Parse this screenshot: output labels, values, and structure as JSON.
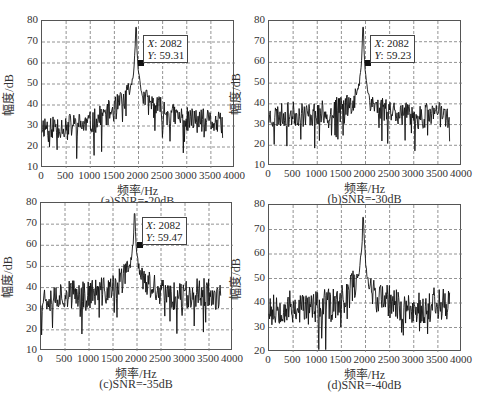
{
  "figure_caption": "",
  "chart_data": [
    {
      "id": "a",
      "type": "line",
      "caption": "(a)SNR=-20dB",
      "xlabel": "频率/Hz",
      "ylabel": "幅度/dB",
      "xlim": [
        0,
        4000
      ],
      "ylim": [
        10,
        80
      ],
      "xticks": [
        0,
        500,
        1000,
        1500,
        2000,
        2500,
        3000,
        3500,
        4000
      ],
      "yticks": [
        10,
        20,
        30,
        40,
        50,
        60,
        70,
        80
      ],
      "grid": true,
      "peak": {
        "x": 1950,
        "y": 77
      },
      "datatip": {
        "x_label": "X",
        "x_value": "2082",
        "y_label": "Y",
        "y_value": "59.31",
        "x": 2082,
        "y": 59.31
      },
      "series": [
        {
          "name": "spectrum",
          "baseline": [
            [
              0,
              30
            ],
            [
              500,
              30
            ],
            [
              1000,
              31
            ],
            [
              1500,
              38
            ],
            [
              1800,
              44
            ],
            [
              2300,
              40
            ],
            [
              2700,
              35
            ],
            [
              3000,
              33
            ],
            [
              3500,
              32
            ],
            [
              3750,
              30
            ]
          ],
          "noise_amp": 6,
          "seed": 11
        }
      ]
    },
    {
      "id": "b",
      "type": "line",
      "caption": "(b)SNR=-30dB",
      "xlabel": "频率/Hz",
      "ylabel": "幅度/dB",
      "xlim": [
        0,
        4000
      ],
      "ylim": [
        10,
        80
      ],
      "xticks": [
        0,
        500,
        1000,
        1500,
        2000,
        2500,
        3000,
        3500,
        4000
      ],
      "yticks": [
        10,
        20,
        30,
        40,
        50,
        60,
        70,
        80
      ],
      "grid": true,
      "peak": {
        "x": 1950,
        "y": 77
      },
      "datatip": {
        "x_label": "X",
        "x_value": "2082",
        "y_label": "Y",
        "y_value": "59.23",
        "x": 2082,
        "y": 59.23
      },
      "series": [
        {
          "name": "spectrum",
          "baseline": [
            [
              0,
              34
            ],
            [
              500,
              35
            ],
            [
              1000,
              35
            ],
            [
              1500,
              38
            ],
            [
              1800,
              42
            ],
            [
              2300,
              38
            ],
            [
              2700,
              36
            ],
            [
              3000,
              33
            ],
            [
              3500,
              36
            ],
            [
              3750,
              34
            ]
          ],
          "noise_amp": 6,
          "seed": 23
        }
      ]
    },
    {
      "id": "c",
      "type": "line",
      "caption": "(c)SNR=-35dB",
      "xlabel": "频率/Hz",
      "ylabel": "幅度/dB",
      "xlim": [
        0,
        4000
      ],
      "ylim": [
        10,
        80
      ],
      "xticks": [
        0,
        500,
        1000,
        1500,
        2000,
        2500,
        3000,
        3500,
        4000
      ],
      "yticks": [
        10,
        20,
        30,
        40,
        50,
        60,
        70,
        80
      ],
      "grid": true,
      "peak": {
        "x": 1950,
        "y": 75
      },
      "datatip": {
        "x_label": "X",
        "x_value": "2082",
        "y_label": "Y",
        "y_value": "59.47",
        "x": 2082,
        "y": 59.47
      },
      "series": [
        {
          "name": "spectrum",
          "baseline": [
            [
              0,
              35
            ],
            [
              500,
              37
            ],
            [
              1000,
              37
            ],
            [
              1500,
              39
            ],
            [
              1800,
              46
            ],
            [
              2300,
              40
            ],
            [
              2700,
              36
            ],
            [
              3000,
              37
            ],
            [
              3500,
              38
            ],
            [
              3750,
              34
            ]
          ],
          "noise_amp": 7,
          "seed": 37
        }
      ]
    },
    {
      "id": "d",
      "type": "line",
      "caption": "(d)SNR=-40dB",
      "xlabel": "频率/Hz",
      "ylabel": "幅度/dB",
      "xlim": [
        0,
        4000
      ],
      "ylim": [
        20,
        80
      ],
      "xticks": [
        0,
        500,
        1000,
        1500,
        2000,
        2500,
        3000,
        3500,
        4000
      ],
      "yticks": [
        20,
        30,
        40,
        50,
        60,
        70,
        80
      ],
      "grid": true,
      "peak": {
        "x": 1950,
        "y": 75
      },
      "datatip": null,
      "series": [
        {
          "name": "spectrum",
          "baseline": [
            [
              0,
              39
            ],
            [
              500,
              38
            ],
            [
              1000,
              38
            ],
            [
              1500,
              40
            ],
            [
              1800,
              48
            ],
            [
              2300,
              42
            ],
            [
              2700,
              39
            ],
            [
              3000,
              37
            ],
            [
              3500,
              40
            ],
            [
              3750,
              40
            ]
          ],
          "noise_amp": 7,
          "seed": 53
        }
      ]
    }
  ]
}
